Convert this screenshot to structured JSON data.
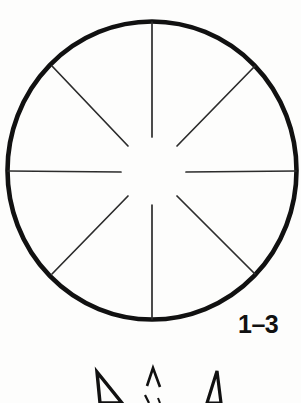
{
  "page": {
    "background_color": "#fdfdfc",
    "ink_color": "#111111",
    "width": 301,
    "height": 403
  },
  "figure": {
    "name": "radial-spoke-circle-diagram",
    "caption": "1–3",
    "circle": {
      "center_x": 152,
      "center_y": 170,
      "radius_x": 145,
      "radius_y": 149,
      "stroke_color": "#111111",
      "stroke_width": 4.5
    },
    "hub": {
      "inner_gap_radius": 34,
      "description": "blank circular gap at center where spokes stop short"
    },
    "spokes": {
      "count": 8,
      "stroke_color": "#2a2a2a",
      "stroke_width": 1.6,
      "inner_radius": 34,
      "outer_radius": 146,
      "angles_deg": [
        0,
        45,
        90,
        135,
        180,
        225,
        270,
        315
      ],
      "labels": [
        "spoke-right",
        "spoke-upper-right",
        "spoke-top",
        "spoke-upper-left",
        "spoke-left",
        "spoke-lower-left",
        "spoke-bottom",
        "spoke-lower-right"
      ]
    },
    "bottom_shapes": {
      "description": "three partially cropped arrowhead marks at the bottom edge of the page",
      "count": 3,
      "items": [
        {
          "name": "arrow-mark-left",
          "x": 100,
          "y": 372
        },
        {
          "name": "arrow-mark-center",
          "x": 152,
          "y": 368
        },
        {
          "name": "arrow-mark-right",
          "x": 205,
          "y": 372
        }
      ]
    }
  }
}
